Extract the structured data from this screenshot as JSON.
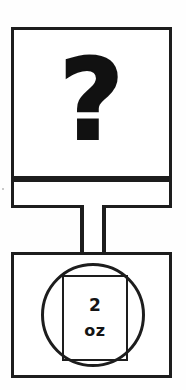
{
  "figure": {
    "kind": "line-drawing",
    "ink_color": "#1d1d1d",
    "background_color": "#fefefe"
  },
  "sign_panel": {
    "name": "question-sign",
    "symbol": "?",
    "symbol_name": "question-mark-glyph"
  },
  "sign_band": {
    "name": "sign-mounting-band",
    "label": ""
  },
  "post": {
    "name": "support-post",
    "label": ""
  },
  "measure_panel": {
    "name": "measure-sign",
    "circle_name": "measure-circle",
    "inner_box_name": "measure-inner-box",
    "amount": "2",
    "unit": "oz"
  }
}
